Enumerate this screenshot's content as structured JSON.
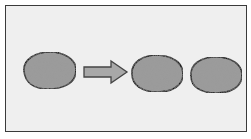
{
  "diagram": {
    "type": "binary-fission",
    "elements": [
      {
        "id": "parent-cell",
        "shape": "oval"
      },
      {
        "id": "arrow",
        "shape": "right-arrow"
      },
      {
        "id": "daughter-cell-1",
        "shape": "oval"
      },
      {
        "id": "daughter-cell-2",
        "shape": "oval"
      }
    ],
    "colors": {
      "background": "#efefef",
      "frame_border": "#3a3a3a",
      "cell_fill": "#9a9a9a",
      "cell_stroke": "#1e1e1e",
      "arrow_fill": "#a8a8a8",
      "arrow_stroke": "#444444"
    }
  }
}
